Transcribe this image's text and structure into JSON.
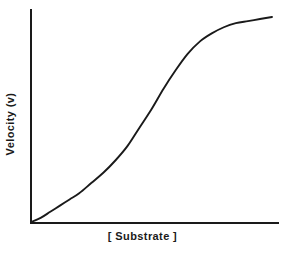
{
  "chart_data": {
    "type": "line",
    "title": "",
    "subtitle": "",
    "xlabel": "[ Substrate ]",
    "ylabel": "Velocity (v)",
    "curve_name": "sigmoidal saturation curve",
    "grid": false,
    "legend": false,
    "legend_position": "none",
    "axis_ticks": false,
    "tick_labels": {
      "x": [],
      "y": []
    },
    "xlim": [
      0,
      1
    ],
    "ylim": [
      0,
      1
    ],
    "annotations": [],
    "series": [
      {
        "name": "Velocity (v)",
        "color": "#1a1a1a",
        "x": [
          0.0,
          0.04,
          0.08,
          0.12,
          0.16,
          0.2,
          0.25,
          0.3,
          0.35,
          0.4,
          0.45,
          0.5,
          0.55,
          0.6,
          0.65,
          0.7,
          0.75,
          0.8,
          0.85,
          0.9,
          0.95,
          1.0
        ],
        "y": [
          0.0,
          0.02,
          0.05,
          0.08,
          0.11,
          0.14,
          0.19,
          0.24,
          0.3,
          0.37,
          0.46,
          0.55,
          0.65,
          0.74,
          0.82,
          0.88,
          0.92,
          0.95,
          0.97,
          0.98,
          0.99,
          1.0
        ]
      }
    ]
  },
  "axes": {
    "x_label": "[ Substrate ]",
    "y_label": "Velocity (v)"
  },
  "colors": {
    "line": "#1a1a1a",
    "axis": "#1a1a1a",
    "background": "#ffffff"
  }
}
